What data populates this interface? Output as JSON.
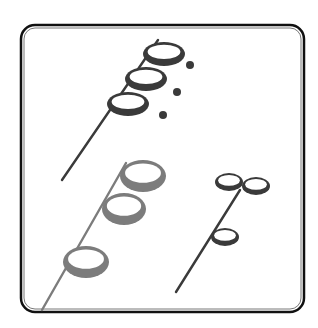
{
  "figure": {
    "background": "#ffffff",
    "frame": {
      "x": 21,
      "y": 25,
      "width": 283,
      "height": 287,
      "radius": 14,
      "outer_color": "#111111",
      "inner_color": "#555555"
    },
    "groups": [
      {
        "name": "top-dark-group",
        "color": "#3a3a3a",
        "stem": {
          "x1": 62,
          "y1": 180,
          "x2": 158,
          "y2": 40
        },
        "rings": [
          {
            "cx": 164,
            "cy": 54,
            "rx": 21,
            "ry": 12
          },
          {
            "cx": 146,
            "cy": 79,
            "rx": 21,
            "ry": 12
          },
          {
            "cx": 128,
            "cy": 104,
            "rx": 21,
            "ry": 12
          }
        ],
        "dots": [
          {
            "cx": 190,
            "cy": 65,
            "r": 4
          },
          {
            "cx": 177,
            "cy": 92,
            "r": 4
          },
          {
            "cx": 163,
            "cy": 115,
            "r": 4
          }
        ]
      },
      {
        "name": "bottom-gray-group",
        "color": "#7c7c7c",
        "stem": {
          "x1": 42,
          "y1": 310,
          "x2": 126,
          "y2": 163
        },
        "rings": [
          {
            "cx": 143,
            "cy": 176,
            "rx": 23,
            "ry": 16
          },
          {
            "cx": 124,
            "cy": 209,
            "rx": 22,
            "ry": 16
          },
          {
            "cx": 86,
            "cy": 262,
            "rx": 23,
            "ry": 16
          }
        ],
        "dots": []
      },
      {
        "name": "right-dark-group",
        "color": "#3a3a3a",
        "stem": {
          "x1": 176,
          "y1": 292,
          "x2": 240,
          "y2": 190
        },
        "rings": [
          {
            "cx": 229,
            "cy": 182,
            "rx": 14,
            "ry": 9
          },
          {
            "cx": 256,
            "cy": 186,
            "rx": 14,
            "ry": 9
          },
          {
            "cx": 225,
            "cy": 237,
            "rx": 14,
            "ry": 9
          }
        ],
        "dots": []
      }
    ]
  }
}
